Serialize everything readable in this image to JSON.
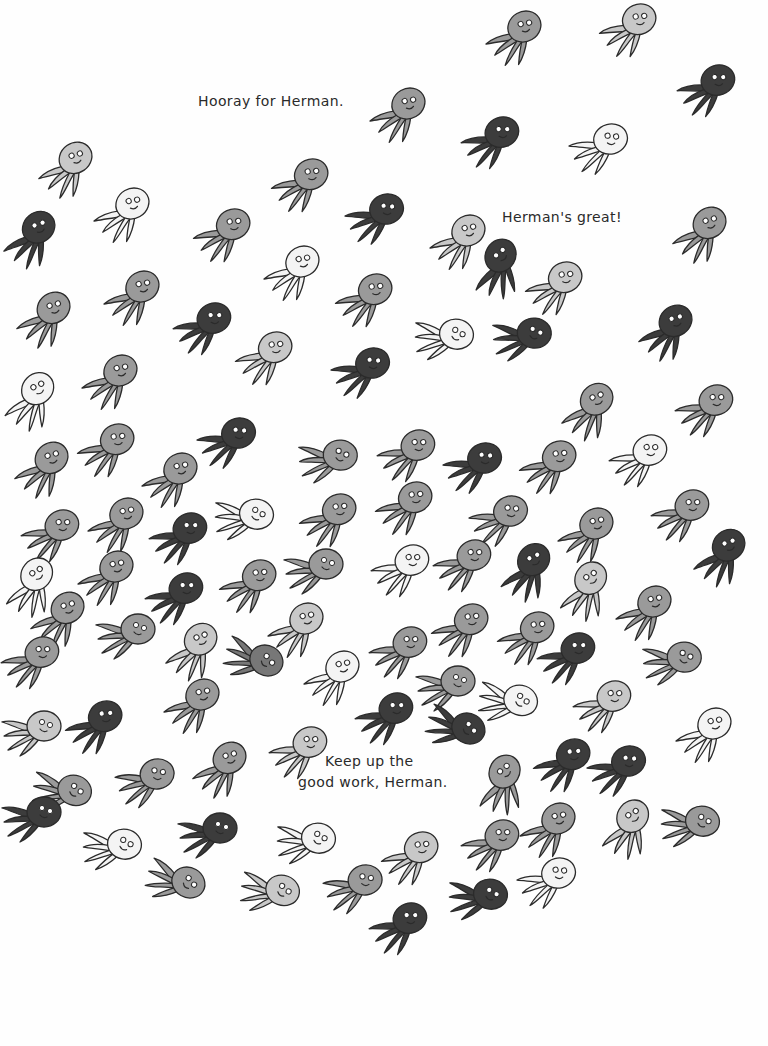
{
  "page": {
    "background": "#fefefe",
    "captions": [
      {
        "id": "hooray",
        "text": "Hooray for Herman.",
        "x": 198,
        "y": 92
      },
      {
        "id": "great",
        "text": "Herman's great!",
        "x": 502,
        "y": 208
      },
      {
        "id": "keep_up_line1",
        "text": "Keep up the",
        "x": 325,
        "y": 752
      },
      {
        "id": "keep_up_line2",
        "text": "good work, Herman.",
        "x": 298,
        "y": 773
      }
    ],
    "shades": {
      "white": "#f4f4f4",
      "light": "#c8c8c8",
      "mid": "#9a9a9a",
      "darkmid": "#777777",
      "dark": "#3c3c3c"
    },
    "octopuses": [
      {
        "x": 484,
        "y": 8,
        "shade": "mid",
        "rot": -30
      },
      {
        "x": 598,
        "y": 0,
        "shade": "light",
        "rot": -25
      },
      {
        "x": 676,
        "y": 60,
        "shade": "dark",
        "rot": -20
      },
      {
        "x": 368,
        "y": 85,
        "shade": "mid",
        "rot": -30
      },
      {
        "x": 460,
        "y": 112,
        "shade": "dark",
        "rot": -20
      },
      {
        "x": 568,
        "y": 118,
        "shade": "white",
        "rot": -15
      },
      {
        "x": 36,
        "y": 140,
        "shade": "light",
        "rot": -35
      },
      {
        "x": 92,
        "y": 185,
        "shade": "white",
        "rot": -30
      },
      {
        "x": 270,
        "y": 155,
        "shade": "mid",
        "rot": -25
      },
      {
        "x": 344,
        "y": 188,
        "shade": "dark",
        "rot": -15
      },
      {
        "x": 0,
        "y": 210,
        "shade": "dark",
        "rot": -40
      },
      {
        "x": 192,
        "y": 205,
        "shade": "mid",
        "rot": -25
      },
      {
        "x": 262,
        "y": 243,
        "shade": "white",
        "rot": -30
      },
      {
        "x": 428,
        "y": 212,
        "shade": "light",
        "rot": -30
      },
      {
        "x": 466,
        "y": 240,
        "shade": "dark",
        "rot": -60
      },
      {
        "x": 524,
        "y": 258,
        "shade": "light",
        "rot": -25
      },
      {
        "x": 670,
        "y": 205,
        "shade": "mid",
        "rot": -35
      },
      {
        "x": 102,
        "y": 268,
        "shade": "mid",
        "rot": -30
      },
      {
        "x": 334,
        "y": 270,
        "shade": "mid",
        "rot": -25
      },
      {
        "x": 14,
        "y": 290,
        "shade": "mid",
        "rot": -35
      },
      {
        "x": 172,
        "y": 298,
        "shade": "dark",
        "rot": -20
      },
      {
        "x": 234,
        "y": 328,
        "shade": "light",
        "rot": -25
      },
      {
        "x": 412,
        "y": 308,
        "shade": "white",
        "rot": 10
      },
      {
        "x": 490,
        "y": 308,
        "shade": "dark",
        "rot": 5
      },
      {
        "x": 636,
        "y": 303,
        "shade": "dark",
        "rot": -35
      },
      {
        "x": 330,
        "y": 342,
        "shade": "dark",
        "rot": -15
      },
      {
        "x": 80,
        "y": 352,
        "shade": "mid",
        "rot": -30
      },
      {
        "x": 0,
        "y": 372,
        "shade": "white",
        "rot": -45
      },
      {
        "x": 558,
        "y": 382,
        "shade": "mid",
        "rot": -40
      },
      {
        "x": 674,
        "y": 380,
        "shade": "mid",
        "rot": -20
      },
      {
        "x": 196,
        "y": 412,
        "shade": "dark",
        "rot": -15
      },
      {
        "x": 296,
        "y": 430,
        "shade": "mid",
        "rot": 5
      },
      {
        "x": 376,
        "y": 425,
        "shade": "mid",
        "rot": -20
      },
      {
        "x": 442,
        "y": 437,
        "shade": "dark",
        "rot": -15
      },
      {
        "x": 518,
        "y": 437,
        "shade": "mid",
        "rot": -25
      },
      {
        "x": 608,
        "y": 430,
        "shade": "white",
        "rot": -20
      },
      {
        "x": 76,
        "y": 420,
        "shade": "mid",
        "rot": -25
      },
      {
        "x": 12,
        "y": 440,
        "shade": "mid",
        "rot": -35
      },
      {
        "x": 140,
        "y": 450,
        "shade": "mid",
        "rot": -30
      },
      {
        "x": 212,
        "y": 488,
        "shade": "white",
        "rot": 10
      },
      {
        "x": 298,
        "y": 490,
        "shade": "mid",
        "rot": -25
      },
      {
        "x": 374,
        "y": 478,
        "shade": "mid",
        "rot": -25
      },
      {
        "x": 468,
        "y": 490,
        "shade": "mid",
        "rot": -15
      },
      {
        "x": 556,
        "y": 505,
        "shade": "mid",
        "rot": -30
      },
      {
        "x": 650,
        "y": 485,
        "shade": "mid",
        "rot": -20
      },
      {
        "x": 20,
        "y": 505,
        "shade": "mid",
        "rot": -20
      },
      {
        "x": 86,
        "y": 495,
        "shade": "mid",
        "rot": -30
      },
      {
        "x": 148,
        "y": 508,
        "shade": "dark",
        "rot": -20
      },
      {
        "x": 690,
        "y": 528,
        "shade": "dark",
        "rot": -40
      },
      {
        "x": 76,
        "y": 548,
        "shade": "mid",
        "rot": -30
      },
      {
        "x": 144,
        "y": 568,
        "shade": "dark",
        "rot": -20
      },
      {
        "x": 218,
        "y": 556,
        "shade": "mid",
        "rot": -25
      },
      {
        "x": 282,
        "y": 540,
        "shade": "mid",
        "rot": 0
      },
      {
        "x": 370,
        "y": 540,
        "shade": "white",
        "rot": -20
      },
      {
        "x": 432,
        "y": 535,
        "shade": "mid",
        "rot": -20
      },
      {
        "x": 496,
        "y": 543,
        "shade": "dark",
        "rot": -45
      },
      {
        "x": 554,
        "y": 562,
        "shade": "light",
        "rot": -50
      },
      {
        "x": 614,
        "y": 583,
        "shade": "mid",
        "rot": -30
      },
      {
        "x": 0,
        "y": 558,
        "shade": "white",
        "rot": -50
      },
      {
        "x": 28,
        "y": 590,
        "shade": "mid",
        "rot": -35
      },
      {
        "x": 94,
        "y": 605,
        "shade": "mid",
        "rot": 0
      },
      {
        "x": 162,
        "y": 622,
        "shade": "light",
        "rot": -40
      },
      {
        "x": 222,
        "y": 630,
        "shade": "darkmid",
        "rot": 30
      },
      {
        "x": 266,
        "y": 600,
        "shade": "light",
        "rot": -30
      },
      {
        "x": 302,
        "y": 648,
        "shade": "white",
        "rot": -30
      },
      {
        "x": 368,
        "y": 622,
        "shade": "mid",
        "rot": -20
      },
      {
        "x": 430,
        "y": 600,
        "shade": "mid",
        "rot": -25
      },
      {
        "x": 496,
        "y": 608,
        "shade": "mid",
        "rot": -25
      },
      {
        "x": 536,
        "y": 628,
        "shade": "dark",
        "rot": -20
      },
      {
        "x": 640,
        "y": 632,
        "shade": "mid",
        "rot": 5
      },
      {
        "x": 0,
        "y": 632,
        "shade": "mid",
        "rot": -20
      },
      {
        "x": 414,
        "y": 657,
        "shade": "mid",
        "rot": 0
      },
      {
        "x": 476,
        "y": 672,
        "shade": "white",
        "rot": 20
      },
      {
        "x": 572,
        "y": 676,
        "shade": "light",
        "rot": -20
      },
      {
        "x": 162,
        "y": 676,
        "shade": "mid",
        "rot": -30
      },
      {
        "x": 354,
        "y": 688,
        "shade": "dark",
        "rot": -20
      },
      {
        "x": 424,
        "y": 698,
        "shade": "dark",
        "rot": 30
      },
      {
        "x": 64,
        "y": 697,
        "shade": "dark",
        "rot": -25
      },
      {
        "x": 0,
        "y": 702,
        "shade": "light",
        "rot": 0
      },
      {
        "x": 674,
        "y": 705,
        "shade": "white",
        "rot": -30
      },
      {
        "x": 190,
        "y": 740,
        "shade": "mid",
        "rot": -35
      },
      {
        "x": 268,
        "y": 722,
        "shade": "light",
        "rot": -20
      },
      {
        "x": 30,
        "y": 762,
        "shade": "mid",
        "rot": 20
      },
      {
        "x": 114,
        "y": 752,
        "shade": "mid",
        "rot": -10
      },
      {
        "x": 470,
        "y": 756,
        "shade": "mid",
        "rot": -60
      },
      {
        "x": 532,
        "y": 735,
        "shade": "dark",
        "rot": -25
      },
      {
        "x": 586,
        "y": 740,
        "shade": "dark",
        "rot": -15
      },
      {
        "x": 0,
        "y": 788,
        "shade": "dark",
        "rot": 0
      },
      {
        "x": 80,
        "y": 818,
        "shade": "white",
        "rot": 10
      },
      {
        "x": 176,
        "y": 804,
        "shade": "dark",
        "rot": 0
      },
      {
        "x": 274,
        "y": 812,
        "shade": "white",
        "rot": 10
      },
      {
        "x": 380,
        "y": 828,
        "shade": "light",
        "rot": -25
      },
      {
        "x": 460,
        "y": 815,
        "shade": "mid",
        "rot": -20
      },
      {
        "x": 518,
        "y": 800,
        "shade": "mid",
        "rot": -30
      },
      {
        "x": 596,
        "y": 800,
        "shade": "light",
        "rot": -50
      },
      {
        "x": 658,
        "y": 795,
        "shade": "mid",
        "rot": 10
      },
      {
        "x": 144,
        "y": 852,
        "shade": "mid",
        "rot": 30
      },
      {
        "x": 238,
        "y": 862,
        "shade": "light",
        "rot": 20
      },
      {
        "x": 322,
        "y": 858,
        "shade": "mid",
        "rot": -10
      },
      {
        "x": 446,
        "y": 868,
        "shade": "dark",
        "rot": 10
      },
      {
        "x": 516,
        "y": 852,
        "shade": "white",
        "rot": -15
      },
      {
        "x": 368,
        "y": 898,
        "shade": "dark",
        "rot": -20
      }
    ]
  }
}
